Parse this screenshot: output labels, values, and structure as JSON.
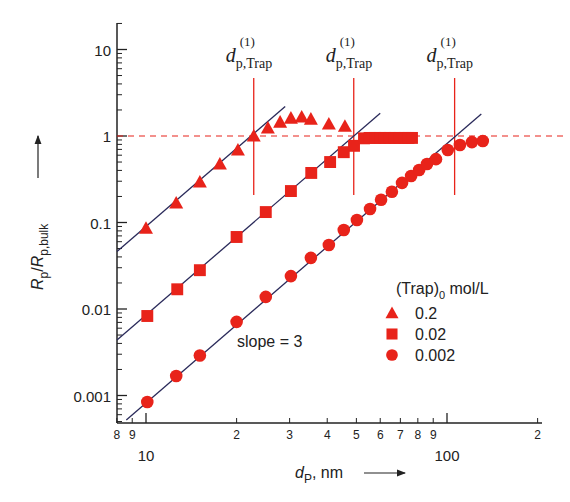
{
  "chart_data": {
    "type": "scatter",
    "title": "",
    "xlabel": "d_P, nm",
    "ylabel": "R_p/R_p,bulk",
    "xscale": "log",
    "yscale": "log",
    "xlim": [
      8,
      200
    ],
    "ylim": [
      0.0005,
      20
    ],
    "x_ticks_major": [
      {
        "value": 10,
        "label": "10"
      },
      {
        "value": 100,
        "label": "100"
      }
    ],
    "x_ticks_minor": [
      {
        "value": 8,
        "label": "8"
      },
      {
        "value": 9,
        "label": "9"
      },
      {
        "value": 20,
        "label": "2"
      },
      {
        "value": 30,
        "label": "3"
      },
      {
        "value": 40,
        "label": "4"
      },
      {
        "value": 50,
        "label": "5"
      },
      {
        "value": 60,
        "label": "6"
      },
      {
        "value": 70,
        "label": "7"
      },
      {
        "value": 80,
        "label": "8"
      },
      {
        "value": 90,
        "label": "9"
      },
      {
        "value": 200,
        "label": "2"
      }
    ],
    "y_ticks": [
      {
        "value": 10,
        "label": "10"
      },
      {
        "value": 1,
        "label": "1"
      },
      {
        "value": 0.1,
        "label": "0.1"
      },
      {
        "value": 0.01,
        "label": "0.01"
      },
      {
        "value": 0.001,
        "label": "0.001"
      }
    ],
    "grid": false,
    "legend_position": "lower right",
    "legend_title": "(Trap)",
    "legend_title_sub": "0",
    "legend_title_unit": " mol/L",
    "series": [
      {
        "name": "0.2",
        "marker": "triangle",
        "color": "#e8231a",
        "x": [
          10,
          12.6,
          15.1,
          17.6,
          20.2,
          22.8,
          25.4,
          27.9,
          30.3,
          32.9,
          35.3,
          40.5,
          45.8
        ],
        "y": [
          0.086,
          0.168,
          0.294,
          0.475,
          0.689,
          1.0,
          1.24,
          1.45,
          1.61,
          1.66,
          1.57,
          1.38,
          1.3
        ]
      },
      {
        "name": "0.02",
        "marker": "square",
        "color": "#e8231a",
        "x": [
          10.1,
          12.7,
          15.1,
          20.0,
          25.0,
          30.3,
          35.4,
          40.9,
          45.4,
          49.1,
          53,
          55.3,
          57.7,
          60,
          62.2,
          64.6,
          67.1,
          69.7,
          72.4,
          74.5,
          76.5
        ],
        "y": [
          0.0083,
          0.0169,
          0.0281,
          0.068,
          0.132,
          0.231,
          0.374,
          0.5,
          0.65,
          0.77,
          0.94,
          0.95,
          0.95,
          0.95,
          0.95,
          0.95,
          0.95,
          0.95,
          0.95,
          0.95,
          0.95
        ]
      },
      {
        "name": "0.002",
        "marker": "circle",
        "color": "#e8231a",
        "x": [
          10.1,
          12.6,
          15.1,
          20.0,
          25.0,
          30.3,
          35.3,
          40.5,
          45.4,
          50.2,
          55.5,
          60.4,
          65.6,
          70.9,
          76.0,
          80.8,
          85.8,
          91.9,
          100.6,
          110.4,
          121.0,
          131.5
        ],
        "y": [
          0.00084,
          0.00168,
          0.0029,
          0.0071,
          0.0138,
          0.024,
          0.039,
          0.055,
          0.082,
          0.107,
          0.143,
          0.183,
          0.227,
          0.287,
          0.345,
          0.405,
          0.475,
          0.54,
          0.69,
          0.787,
          0.85,
          0.875
        ]
      }
    ],
    "fit_lines": [
      {
        "series": "0.2",
        "slope": 3,
        "x_range": [
          8,
          29
        ],
        "y_at_10": 0.09
      },
      {
        "series": "0.02",
        "slope": 3,
        "x_range": [
          8,
          60
        ],
        "y_at_10": 0.0085
      },
      {
        "series": "0.002",
        "slope": 3,
        "x_range": [
          8.6,
          130
        ],
        "y_at_10": 0.00082
      }
    ],
    "reference_lines": {
      "horizontal_dashed": {
        "y": 1,
        "color": "#e8231a"
      },
      "verticals": [
        {
          "x": 22.8,
          "label": "d",
          "label_sub": "p,Trap",
          "label_sup": "(1)"
        },
        {
          "x": 49,
          "label": "d",
          "label_sub": "p,Trap",
          "label_sup": "(1)"
        },
        {
          "x": 106,
          "label": "d",
          "label_sub": "p,Trap",
          "label_sup": "(1)"
        }
      ]
    },
    "annotations": [
      {
        "text": "slope = 3",
        "x": 30,
        "y": 0.0035
      }
    ]
  },
  "labels": {
    "xlabel_main": "d",
    "xlabel_sub": "P",
    "xlabel_unit": ", nm",
    "ylabel_R": "R",
    "ylabel_sub1": "p",
    "ylabel_slash": "/",
    "ylabel_sub2": "p,bulk",
    "slope_text": "slope = 3",
    "vline_d": "d",
    "vline_sub": "p,Trap",
    "vline_sup": "(1)"
  }
}
